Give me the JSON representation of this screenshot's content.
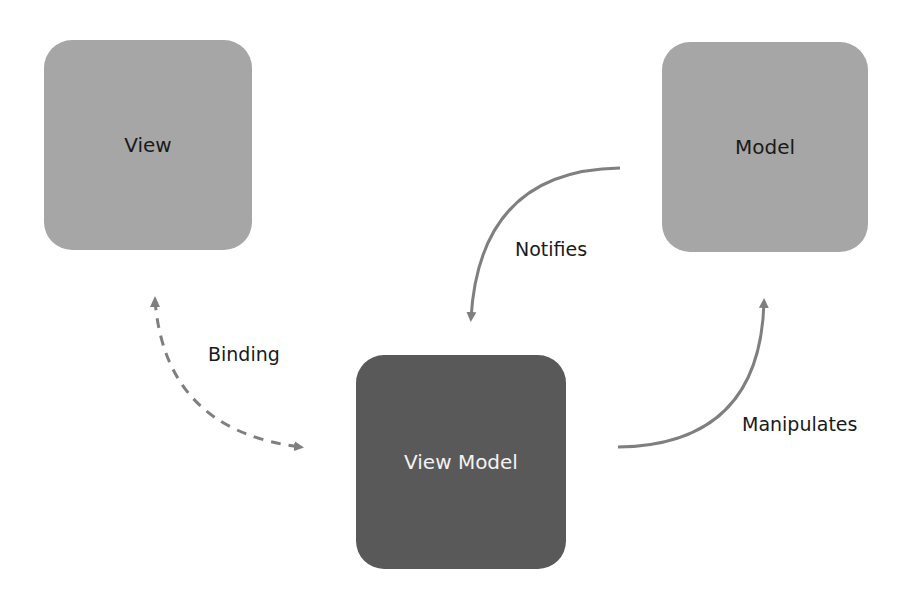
{
  "diagram": {
    "nodes": [
      {
        "id": "view",
        "label": "View",
        "fill": "#a6a6a6"
      },
      {
        "id": "model",
        "label": "Model",
        "fill": "#a6a6a6"
      },
      {
        "id": "view_model",
        "label": "View Model",
        "fill": "#595959"
      }
    ],
    "edges": [
      {
        "from": "view",
        "to": "view_model",
        "label": "Binding",
        "style": "dashed",
        "bidirectional": true
      },
      {
        "from": "model",
        "to": "view_model",
        "label": "Notifies",
        "style": "solid"
      },
      {
        "from": "view_model",
        "to": "model",
        "label": "Manipulates",
        "style": "solid"
      }
    ],
    "arrow_color": "#7f7f7f"
  }
}
